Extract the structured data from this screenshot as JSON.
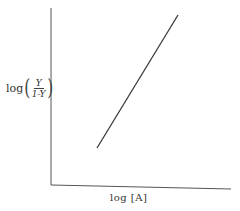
{
  "chart_data": {
    "type": "line",
    "title": "",
    "xlabel": "log [A]",
    "ylabel": "log(Y / (1-Y))",
    "ylabel_parts": {
      "prefix": "log",
      "numerator": "Y",
      "denominator": "1-Y"
    },
    "grid": false,
    "legend": null,
    "axis_ticks": "none",
    "series": [
      {
        "name": "Hill plot",
        "points_px": [
          [
            97,
            148
          ],
          [
            178,
            15
          ]
        ],
        "relative_points": [
          [
            0.26,
            0.21
          ],
          [
            0.71,
            0.96
          ]
        ],
        "color": "#3a3a3a"
      }
    ],
    "axes_px": {
      "origin": [
        51,
        185
      ],
      "y_top": [
        51,
        8
      ],
      "x_end": [
        230,
        189
      ]
    }
  }
}
